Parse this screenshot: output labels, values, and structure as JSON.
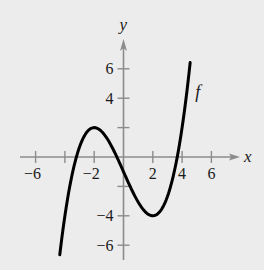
{
  "chart_data": {
    "type": "line",
    "title": "",
    "xlabel": "x",
    "ylabel": "y",
    "xlim": [
      -7.6,
      7.6
    ],
    "ylim": [
      -7.2,
      8.0
    ],
    "xticks": [
      -6,
      -4,
      -2,
      2,
      4,
      6
    ],
    "xtick_labels": [
      "−6",
      "",
      "−2",
      "2",
      "4",
      "6"
    ],
    "yticks": [
      -6,
      -4,
      -2,
      2,
      4,
      6
    ],
    "ytick_labels": [
      "−6",
      "−4",
      "",
      "",
      "4",
      "6"
    ],
    "grid": false,
    "series": [
      {
        "name": "f",
        "label_position": {
          "x": 4.9,
          "y": 4.0
        },
        "formula_estimate": "f(x) ≈ (3/16)x^3 − (9/4)x − 1",
        "key_points": {
          "local_max": [
            -2,
            2
          ],
          "local_min": [
            2,
            -4
          ],
          "x_intercepts_approx": [
            -3.2,
            -0.4,
            3.6
          ],
          "y_intercept_approx": -1
        },
        "x": [
          -4.35,
          -4.0,
          -3.5,
          -3.0,
          -2.5,
          -2.0,
          -1.5,
          -1.0,
          -0.5,
          0.0,
          0.5,
          1.0,
          1.5,
          2.0,
          2.5,
          3.0,
          3.5,
          4.0,
          4.55
        ],
        "y": [
          -6.6,
          -4.0,
          -1.16,
          0.69,
          1.7,
          2.0,
          1.74,
          1.06,
          0.1,
          -1.0,
          -2.1,
          -3.06,
          -3.74,
          -4.0,
          -3.7,
          -2.69,
          -0.84,
          2.0,
          6.4
        ]
      }
    ]
  },
  "colors": {
    "background": "#ececec",
    "axis": "#8c8c8c",
    "curve": "#000000",
    "text": "#1a1a1a"
  }
}
